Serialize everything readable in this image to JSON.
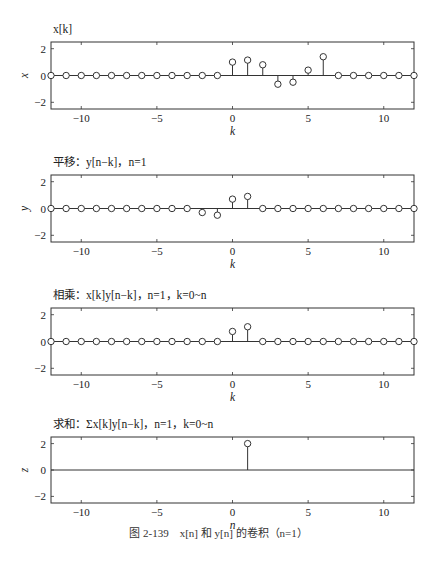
{
  "caption": {
    "prefix": "图 2-139",
    "text": "x[n] 和 y[n] 的卷积（n=1）"
  },
  "layout": {
    "x_left_px": 51,
    "x_right_px": 414,
    "xlim": [
      -12,
      12
    ],
    "ylim": [
      -2.5,
      2.5
    ],
    "xticks": [
      -10,
      -5,
      0,
      5,
      10
    ],
    "yticks": [
      -2,
      0,
      2
    ],
    "panels_px": [
      {
        "top": 42,
        "bottom": 109,
        "title_y": 33,
        "xlabel_y": 135
      },
      {
        "top": 175,
        "bottom": 242,
        "title_y": 166,
        "xlabel_y": 268
      },
      {
        "top": 308,
        "bottom": 375,
        "title_y": 299,
        "xlabel_y": 401
      },
      {
        "top": 437,
        "bottom": 503,
        "title_y": 428,
        "xlabel_y": 529
      }
    ]
  },
  "chart_data": [
    {
      "type": "stem",
      "title": "x[k]",
      "xlabel": "k",
      "ylabel": "x",
      "xlim": [
        -12,
        12
      ],
      "ylim": [
        -2.5,
        2.5
      ],
      "xticks": [
        -10,
        -5,
        0,
        5,
        10
      ],
      "yticks": [
        -2,
        0,
        2
      ],
      "markers_at_zero": true,
      "x": [
        -12,
        -11,
        -10,
        -9,
        -8,
        -7,
        -6,
        -5,
        -4,
        -3,
        -2,
        -1,
        0,
        1,
        2,
        3,
        4,
        5,
        6,
        7,
        8,
        9,
        10,
        11,
        12
      ],
      "values": [
        0,
        0,
        0,
        0,
        0,
        0,
        0,
        0,
        0,
        0,
        0,
        0,
        1.0,
        1.15,
        0.8,
        -0.65,
        -0.5,
        0.4,
        1.4,
        0,
        0,
        0,
        0,
        0,
        0
      ]
    },
    {
      "type": "stem",
      "title": "平移：y[n−k]，n=1",
      "xlabel": "k",
      "ylabel": "y",
      "xlim": [
        -12,
        12
      ],
      "ylim": [
        -2.5,
        2.5
      ],
      "xticks": [
        -10,
        -5,
        0,
        5,
        10
      ],
      "yticks": [
        -2,
        0,
        2
      ],
      "markers_at_zero": true,
      "x": [
        -12,
        -11,
        -10,
        -9,
        -8,
        -7,
        -6,
        -5,
        -4,
        -3,
        -2,
        -1,
        0,
        1,
        2,
        3,
        4,
        5,
        6,
        7,
        8,
        9,
        10,
        11,
        12
      ],
      "values": [
        0,
        0,
        0,
        0,
        0,
        0,
        0,
        0,
        0,
        0,
        -0.3,
        -0.5,
        0.7,
        0.9,
        0,
        0,
        0,
        0,
        0,
        0,
        0,
        0,
        0,
        0,
        0
      ]
    },
    {
      "type": "stem",
      "title": "相乘：x[k]y[n−k]，n=1，k=0~n",
      "xlabel": "k",
      "ylabel": "",
      "xlim": [
        -12,
        12
      ],
      "ylim": [
        -2.5,
        2.5
      ],
      "xticks": [
        -10,
        -5,
        0,
        5,
        10
      ],
      "yticks": [
        -2,
        0,
        2
      ],
      "markers_at_zero": true,
      "x": [
        -12,
        -11,
        -10,
        -9,
        -8,
        -7,
        -6,
        -5,
        -4,
        -3,
        -2,
        -1,
        0,
        1,
        2,
        3,
        4,
        5,
        6,
        7,
        8,
        9,
        10,
        11,
        12
      ],
      "values": [
        0,
        0,
        0,
        0,
        0,
        0,
        0,
        0,
        0,
        0,
        0,
        0,
        0.75,
        1.1,
        0,
        0,
        0,
        0,
        0,
        0,
        0,
        0,
        0,
        0,
        0
      ]
    },
    {
      "type": "stem",
      "title": "求和：Σx[k]y[n−k]，n=1，k=0~n",
      "xlabel": "n",
      "ylabel": "z",
      "xlim": [
        -12,
        12
      ],
      "ylim": [
        -2.5,
        2.5
      ],
      "xticks": [
        -10,
        -5,
        0,
        5,
        10
      ],
      "yticks": [
        -2,
        0,
        2
      ],
      "markers_at_zero": false,
      "x": [
        1
      ],
      "values": [
        2.0
      ]
    }
  ]
}
